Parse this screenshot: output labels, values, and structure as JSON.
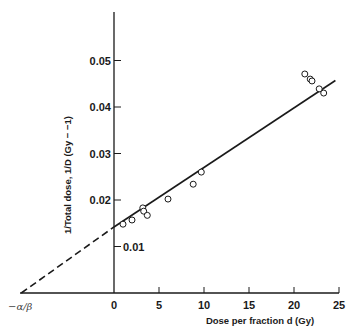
{
  "chart_data": {
    "type": "scatter",
    "title": "",
    "xlabel": "Dose per fraction d (Gy)",
    "ylabel": "1/Total dose, 1/D (Gy − −1)",
    "x_ticks": [
      "0",
      "5",
      "10",
      "15",
      "20",
      "25"
    ],
    "x_tick_values": [
      0,
      5,
      10,
      15,
      20,
      25
    ],
    "y_ticks": [
      "0.01",
      "0.02",
      "0.03",
      "0.04",
      "0.05"
    ],
    "y_tick_values": [
      0.01,
      0.02,
      0.03,
      0.04,
      0.05
    ],
    "xlim": [
      -10.5,
      25
    ],
    "ylim": [
      0,
      0.0575
    ],
    "grid": false,
    "legend": null,
    "annotations": [
      {
        "text": "−α/β",
        "x": -10.3,
        "y": 0,
        "note": "x-intercept of extrapolated dashed fit line"
      }
    ],
    "series": [
      {
        "name": "data",
        "marker": "open-circle",
        "points": [
          {
            "x": 1.0,
            "y": 0.0148
          },
          {
            "x": 2.0,
            "y": 0.0157
          },
          {
            "x": 3.2,
            "y": 0.0183
          },
          {
            "x": 3.3,
            "y": 0.0176
          },
          {
            "x": 3.7,
            "y": 0.0167
          },
          {
            "x": 6.0,
            "y": 0.0202
          },
          {
            "x": 8.8,
            "y": 0.0234
          },
          {
            "x": 9.7,
            "y": 0.026
          },
          {
            "x": 21.2,
            "y": 0.0471
          },
          {
            "x": 21.8,
            "y": 0.046
          },
          {
            "x": 22.0,
            "y": 0.0456
          },
          {
            "x": 22.8,
            "y": 0.0439
          },
          {
            "x": 23.3,
            "y": 0.043
          }
        ]
      },
      {
        "name": "linear fit",
        "style": "solid",
        "x": [
          0,
          24.6
        ],
        "y": [
          0.0142,
          0.0457
        ]
      },
      {
        "name": "extrapolation",
        "style": "dashed",
        "x": [
          -10.3,
          0
        ],
        "y": [
          0,
          0.0142
        ]
      }
    ]
  },
  "labels": {
    "alpha_beta": "−α/β",
    "xlabel": "Dose per fraction d (Gy)",
    "ylabel": "1/Total dose, 1/D (Gy − −1)"
  }
}
